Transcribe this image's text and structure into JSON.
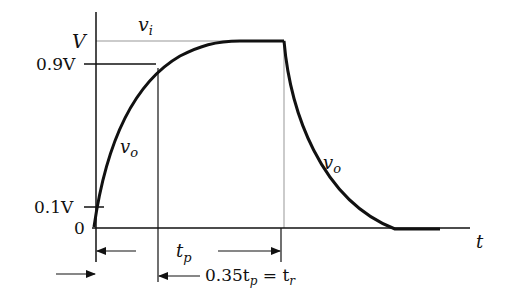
{
  "diagram": {
    "y_labels": {
      "V": "V",
      "v09": "0.9V",
      "v01": "0.1V",
      "zero": "0"
    },
    "curve_labels": {
      "input": "v",
      "input_sub": "i",
      "output_rise": "v",
      "output_rise_sub": "o",
      "output_fall": "v",
      "output_fall_sub": "o"
    },
    "axis_label": "t",
    "dimensions": {
      "tp": "t",
      "tp_sub": "p",
      "tr_prefix": "0.35t",
      "tr_prefix_sub": "p",
      "tr_eq": " = t",
      "tr_sub": "r"
    },
    "colors": {
      "ink": "#111111",
      "input_pulse": "#bbbbbb"
    }
  }
}
